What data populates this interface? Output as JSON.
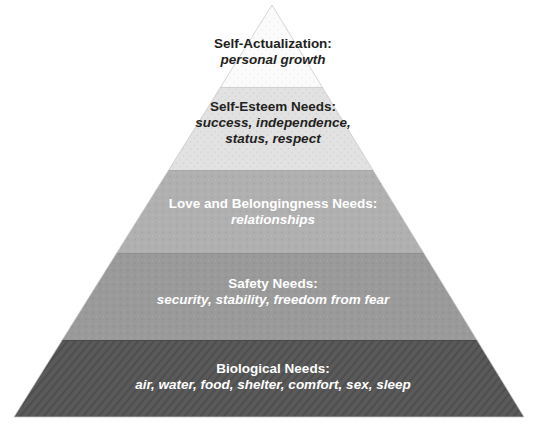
{
  "diagram": {
    "type": "pyramid",
    "background_color": "#ffffff",
    "apex": {
      "x": 272,
      "y": 5
    },
    "base_left": {
      "x": 14,
      "y": 417
    },
    "base_right": {
      "x": 524,
      "y": 417
    },
    "tiers": [
      {
        "id": "self-actualization",
        "title": "Self-Actualization:",
        "description": "personal growth",
        "fill_color": "#fbfbfb",
        "text_color": "#231f20",
        "texture": "dotted",
        "y_top": 5,
        "y_bottom": 87
      },
      {
        "id": "self-esteem",
        "title": "Self-Esteem Needs:",
        "description": "success, independence,\nstatus, respect",
        "description_line_1": "success, independence,",
        "description_line_2": "status, respect",
        "fill_color": "#e2e2e2",
        "text_color": "#231f20",
        "texture": "speckled",
        "y_top": 87,
        "y_bottom": 170
      },
      {
        "id": "love-and-belongingness",
        "title": "Love and Belongingness Needs:",
        "description": "relationships",
        "fill_color": "#b0b0b0",
        "text_color": "#ffffff",
        "texture": "speckled",
        "y_top": 170,
        "y_bottom": 253
      },
      {
        "id": "safety",
        "title": "Safety Needs:",
        "description": "security, stability, freedom from fear",
        "fill_color": "#9a9a9a",
        "text_color": "#ffffff",
        "texture": "speckled",
        "y_top": 253,
        "y_bottom": 340
      },
      {
        "id": "biological",
        "title": "Biological Needs:",
        "description": "air, water, food, shelter, comfort, sex, sleep",
        "fill_color": "#5a5a5a",
        "text_color": "#ffffff",
        "texture": "diagonal-stripes",
        "y_top": 340,
        "y_bottom": 417
      }
    ]
  }
}
